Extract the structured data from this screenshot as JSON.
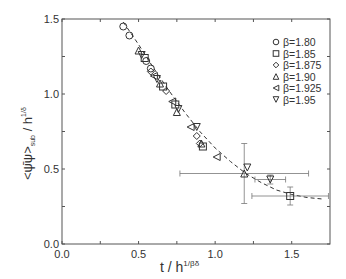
{
  "chart_data": {
    "type": "scatter",
    "title": "",
    "xlabel": "t / h^(1/βδ)",
    "ylabel": "<ψ̄ψ>_sub / h^(1/δ)",
    "xlim": [
      0.0,
      1.75
    ],
    "ylim": [
      0.0,
      1.5
    ],
    "xticks": [
      "0.0",
      "0.5",
      "1.0",
      "1.5"
    ],
    "yticks": [
      "0.0",
      "0.5",
      "1.0",
      "1.5"
    ],
    "grid": false,
    "legend_position": "upper right",
    "fit_curve": {
      "style": "dashed",
      "points": [
        [
          0.4,
          1.48
        ],
        [
          0.5,
          1.33
        ],
        [
          0.6,
          1.17
        ],
        [
          0.7,
          1.02
        ],
        [
          0.8,
          0.88
        ],
        [
          0.9,
          0.75
        ],
        [
          1.0,
          0.64
        ],
        [
          1.1,
          0.55
        ],
        [
          1.2,
          0.47
        ],
        [
          1.3,
          0.41
        ],
        [
          1.4,
          0.36
        ],
        [
          1.5,
          0.33
        ],
        [
          1.6,
          0.31
        ],
        [
          1.7,
          0.3
        ]
      ]
    },
    "series": [
      {
        "name": "β=1.80",
        "marker": "circle",
        "points": [
          [
            0.4,
            1.45
          ],
          [
            0.44,
            1.39
          ],
          [
            0.55,
            1.22
          ],
          [
            0.58,
            1.17
          ]
        ]
      },
      {
        "name": "β=1.85",
        "marker": "square",
        "points": [
          [
            0.54,
            1.24
          ],
          [
            0.66,
            1.05
          ],
          [
            0.74,
            0.93
          ],
          [
            0.92,
            0.65
          ],
          [
            1.49,
            0.32
          ]
        ],
        "yerr": [
          0,
          0,
          0,
          0,
          0.06
        ],
        "xerr": [
          0,
          0,
          0,
          0,
          0.25
        ]
      },
      {
        "name": "β=1.875",
        "marker": "diamond",
        "points": [
          [
            0.58,
            1.15
          ],
          [
            0.68,
            1.02
          ],
          [
            0.88,
            0.72
          ],
          [
            0.9,
            0.67
          ]
        ]
      },
      {
        "name": "β=1.90",
        "marker": "triangle-up",
        "points": [
          [
            0.5,
            1.29
          ],
          [
            0.64,
            1.07
          ],
          [
            0.75,
            0.88
          ],
          [
            0.91,
            0.67
          ],
          [
            1.19,
            0.47
          ]
        ],
        "yerr": [
          0,
          0,
          0,
          0,
          0.2
        ],
        "xerr": [
          0,
          0,
          0,
          0,
          0.42
        ]
      },
      {
        "name": "β=1.925",
        "marker": "triangle-left",
        "points": [
          [
            0.6,
            1.12
          ],
          [
            0.72,
            0.95
          ],
          [
            0.84,
            0.78
          ],
          [
            1.01,
            0.58
          ]
        ]
      },
      {
        "name": "β=1.95",
        "marker": "triangle-down",
        "points": [
          [
            0.52,
            1.26
          ],
          [
            0.62,
            1.1
          ],
          [
            0.76,
            0.9
          ],
          [
            0.88,
            0.78
          ],
          [
            1.21,
            0.51
          ],
          [
            1.36,
            0.43
          ]
        ],
        "yerr": [
          0,
          0,
          0,
          0,
          0,
          0.03
        ],
        "xerr": [
          0,
          0,
          0,
          0,
          0,
          0.1
        ]
      }
    ]
  },
  "axes": {
    "x_tick_labels": [
      "0.0",
      "0.5",
      "1.0",
      "1.5"
    ],
    "y_tick_labels": [
      "0.0",
      "0.5",
      "1.0",
      "1.5"
    ]
  },
  "labels": {
    "x_main": "t / h",
    "x_sup": "1/βδ",
    "y_main": "<ψ̄ψ>",
    "y_sub": "sub",
    "y_rest": " / h",
    "y_sup": "1/δ"
  },
  "legend": [
    "β=1.80",
    "β=1.85",
    "β=1.875",
    "β=1.90",
    "β=1.925",
    "β=1.95"
  ]
}
